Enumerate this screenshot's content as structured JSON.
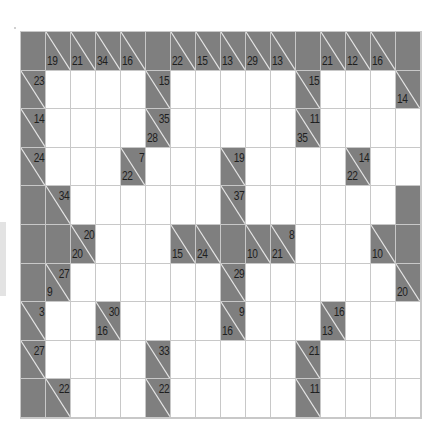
{
  "puzzle": {
    "type": "kakuro",
    "rows": 10,
    "cols": 16,
    "colors": {
      "clue_bg": "#7f7f7f",
      "white": "#ffffff",
      "grid_line": "#c8c8c8",
      "text": "#1e1e1e"
    },
    "grid": [
      [
        {
          "t": "s"
        },
        {
          "t": "c",
          "d": "19"
        },
        {
          "t": "c",
          "d": "21"
        },
        {
          "t": "c",
          "d": "34"
        },
        {
          "t": "c",
          "d": "16"
        },
        {
          "t": "s"
        },
        {
          "t": "c",
          "d": "22"
        },
        {
          "t": "c",
          "d": "15"
        },
        {
          "t": "c",
          "d": "13"
        },
        {
          "t": "c",
          "d": "29"
        },
        {
          "t": "c",
          "d": "13"
        },
        {
          "t": "s"
        },
        {
          "t": "c",
          "d": "21"
        },
        {
          "t": "c",
          "d": "12"
        },
        {
          "t": "c",
          "d": "16"
        },
        {
          "t": "s"
        }
      ],
      [
        {
          "t": "c",
          "a": "23"
        },
        {
          "t": "w"
        },
        {
          "t": "w"
        },
        {
          "t": "w"
        },
        {
          "t": "w"
        },
        {
          "t": "c",
          "a": "15"
        },
        {
          "t": "w"
        },
        {
          "t": "w"
        },
        {
          "t": "w"
        },
        {
          "t": "w"
        },
        {
          "t": "w"
        },
        {
          "t": "c",
          "a": "15"
        },
        {
          "t": "w"
        },
        {
          "t": "w"
        },
        {
          "t": "w"
        },
        {
          "t": "c",
          "d": "14"
        }
      ],
      [
        {
          "t": "c",
          "a": "14"
        },
        {
          "t": "w"
        },
        {
          "t": "w"
        },
        {
          "t": "w"
        },
        {
          "t": "w"
        },
        {
          "t": "c",
          "a": "35",
          "d": "28"
        },
        {
          "t": "w"
        },
        {
          "t": "w"
        },
        {
          "t": "w"
        },
        {
          "t": "w"
        },
        {
          "t": "w"
        },
        {
          "t": "c",
          "a": "11",
          "d": "35"
        },
        {
          "t": "w"
        },
        {
          "t": "w"
        },
        {
          "t": "w"
        },
        {
          "t": "w"
        }
      ],
      [
        {
          "t": "c",
          "a": "24"
        },
        {
          "t": "w"
        },
        {
          "t": "w"
        },
        {
          "t": "w"
        },
        {
          "t": "c",
          "a": "7",
          "d": "22"
        },
        {
          "t": "w"
        },
        {
          "t": "w"
        },
        {
          "t": "w"
        },
        {
          "t": "c",
          "a": "19"
        },
        {
          "t": "w"
        },
        {
          "t": "w"
        },
        {
          "t": "w"
        },
        {
          "t": "w"
        },
        {
          "t": "c",
          "a": "14",
          "d": "22"
        },
        {
          "t": "w"
        },
        {
          "t": "w"
        }
      ],
      [
        {
          "t": "s"
        },
        {
          "t": "c",
          "a": "34"
        },
        {
          "t": "w"
        },
        {
          "t": "w"
        },
        {
          "t": "w"
        },
        {
          "t": "w"
        },
        {
          "t": "w"
        },
        {
          "t": "w"
        },
        {
          "t": "c",
          "a": "37"
        },
        {
          "t": "w"
        },
        {
          "t": "w"
        },
        {
          "t": "w"
        },
        {
          "t": "w"
        },
        {
          "t": "w"
        },
        {
          "t": "w"
        },
        {
          "t": "s"
        }
      ],
      [
        {
          "t": "s"
        },
        {
          "t": "s"
        },
        {
          "t": "c",
          "a": "20",
          "d": "20"
        },
        {
          "t": "w"
        },
        {
          "t": "w"
        },
        {
          "t": "w"
        },
        {
          "t": "c",
          "d": "15"
        },
        {
          "t": "c",
          "d": "24"
        },
        {
          "t": "s"
        },
        {
          "t": "c",
          "d": "10"
        },
        {
          "t": "c",
          "a": "8",
          "d": "21"
        },
        {
          "t": "w"
        },
        {
          "t": "w"
        },
        {
          "t": "w"
        },
        {
          "t": "c",
          "d": "10"
        },
        {
          "t": "s"
        }
      ],
      [
        {
          "t": "s"
        },
        {
          "t": "c",
          "a": "27",
          "d": "9"
        },
        {
          "t": "w"
        },
        {
          "t": "w"
        },
        {
          "t": "w"
        },
        {
          "t": "w"
        },
        {
          "t": "w"
        },
        {
          "t": "w"
        },
        {
          "t": "c",
          "a": "29"
        },
        {
          "t": "w"
        },
        {
          "t": "w"
        },
        {
          "t": "w"
        },
        {
          "t": "w"
        },
        {
          "t": "w"
        },
        {
          "t": "w"
        },
        {
          "t": "c",
          "d": "20"
        }
      ],
      [
        {
          "t": "c",
          "a": "3"
        },
        {
          "t": "w"
        },
        {
          "t": "w"
        },
        {
          "t": "c",
          "a": "30",
          "d": "16"
        },
        {
          "t": "w"
        },
        {
          "t": "w"
        },
        {
          "t": "w"
        },
        {
          "t": "w"
        },
        {
          "t": "c",
          "a": "9",
          "d": "16"
        },
        {
          "t": "w"
        },
        {
          "t": "w"
        },
        {
          "t": "w"
        },
        {
          "t": "c",
          "a": "16",
          "d": "13"
        },
        {
          "t": "w"
        },
        {
          "t": "w"
        },
        {
          "t": "w"
        }
      ],
      [
        {
          "t": "c",
          "a": "27"
        },
        {
          "t": "w"
        },
        {
          "t": "w"
        },
        {
          "t": "w"
        },
        {
          "t": "w"
        },
        {
          "t": "c",
          "a": "33"
        },
        {
          "t": "w"
        },
        {
          "t": "w"
        },
        {
          "t": "w"
        },
        {
          "t": "w"
        },
        {
          "t": "w"
        },
        {
          "t": "c",
          "a": "21"
        },
        {
          "t": "w"
        },
        {
          "t": "w"
        },
        {
          "t": "w"
        },
        {
          "t": "w"
        }
      ],
      [
        {
          "t": "s"
        },
        {
          "t": "c",
          "a": "22"
        },
        {
          "t": "w"
        },
        {
          "t": "w"
        },
        {
          "t": "w"
        },
        {
          "t": "c",
          "a": "22"
        },
        {
          "t": "w"
        },
        {
          "t": "w"
        },
        {
          "t": "w"
        },
        {
          "t": "w"
        },
        {
          "t": "w"
        },
        {
          "t": "c",
          "a": "11"
        },
        {
          "t": "w"
        },
        {
          "t": "w"
        },
        {
          "t": "w"
        },
        {
          "t": "w"
        }
      ]
    ]
  }
}
